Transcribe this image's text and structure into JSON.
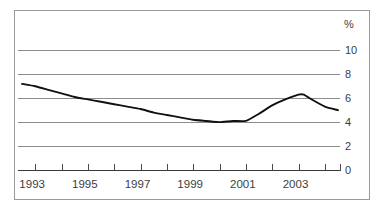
{
  "chart_data": {
    "type": "line",
    "title": "",
    "subtitle": "",
    "xlabel": "",
    "ylabel": "%",
    "unit_label": "%",
    "xlim": [
      1992.5,
      2004.5
    ],
    "ylim": [
      0,
      11.2
    ],
    "grid": true,
    "grid_axis": "y",
    "legend": false,
    "y_ticks": [
      0,
      2,
      4,
      6,
      8,
      10
    ],
    "y_tick_labels": [
      "0",
      "2",
      "4",
      "6",
      "8",
      "10"
    ],
    "x_ticks": [
      1993,
      1994,
      1995,
      1996,
      1997,
      1998,
      1999,
      2000,
      2001,
      2002,
      2003,
      2004
    ],
    "x_tick_labels": [
      "1993",
      "1995",
      "1997",
      "1999",
      "2001",
      "2003"
    ],
    "x_labeled_ticks": [
      1993,
      1995,
      1997,
      1999,
      2001,
      2003
    ],
    "series": [
      {
        "name": "rate",
        "color": "#111111",
        "x": [
          1992.5,
          1993.0,
          1993.5,
          1994.0,
          1994.5,
          1995.0,
          1995.5,
          1996.0,
          1996.5,
          1997.0,
          1997.5,
          1998.0,
          1998.5,
          1999.0,
          1999.5,
          2000.0,
          2000.5,
          2001.0,
          2001.5,
          2002.0,
          2002.5,
          2003.0,
          2003.2,
          2003.5,
          2004.0,
          2004.5
        ],
        "values": [
          7.2,
          7.0,
          6.7,
          6.4,
          6.1,
          5.9,
          5.7,
          5.5,
          5.3,
          5.1,
          4.8,
          4.6,
          4.4,
          4.2,
          4.1,
          4.0,
          4.1,
          4.1,
          4.7,
          5.4,
          5.9,
          6.3,
          6.3,
          5.9,
          5.3,
          5.0
        ]
      }
    ]
  },
  "figure": {
    "frame_color": "#9a9a9a",
    "grid_color": "#8d8d8d",
    "line_color": "#111111",
    "background": "#ffffff",
    "text_color": "#3d3d3d"
  }
}
